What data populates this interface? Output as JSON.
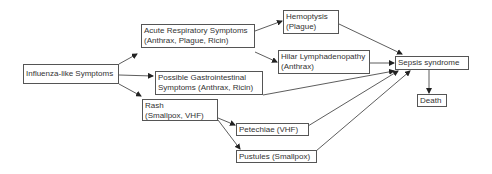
{
  "nodes": {
    "influenza": {
      "line1": "Influenza-like Symptoms"
    },
    "respiratory": {
      "line1": "Acute Respiratory Symptoms",
      "line2": "(Anthrax, Plague, Ricin)"
    },
    "gastro": {
      "line1": "Possible Gastrointestinal",
      "line2": "Symptoms (Anthrax, Ricin)"
    },
    "rash": {
      "line1": "Rash",
      "line2": "(Smallpox, VHF)"
    },
    "hemoptysis": {
      "line1": "Hemoptysis",
      "line2": "(Plague)"
    },
    "hilar": {
      "line1": "Hilar Lymphadenopathy",
      "line2": "(Anthrax)"
    },
    "petechiae": {
      "line1": "Petechiae (VHF)"
    },
    "pustules": {
      "line1": "Pustules (Smallpox)"
    },
    "sepsis": {
      "line1": "Sepsis syndrome"
    },
    "death": {
      "line1": "Death"
    }
  },
  "edges": [
    [
      "influenza",
      "respiratory"
    ],
    [
      "influenza",
      "gastro"
    ],
    [
      "influenza",
      "rash"
    ],
    [
      "respiratory",
      "hemoptysis"
    ],
    [
      "respiratory",
      "hilar"
    ],
    [
      "hemoptysis",
      "sepsis"
    ],
    [
      "hilar",
      "sepsis"
    ],
    [
      "gastro",
      "sepsis"
    ],
    [
      "rash",
      "petechiae"
    ],
    [
      "rash",
      "pustules"
    ],
    [
      "petechiae",
      "sepsis"
    ],
    [
      "pustules",
      "sepsis"
    ],
    [
      "sepsis",
      "death"
    ]
  ],
  "colors": {
    "line": "#333333",
    "border": "#555555",
    "text": "#333333"
  }
}
